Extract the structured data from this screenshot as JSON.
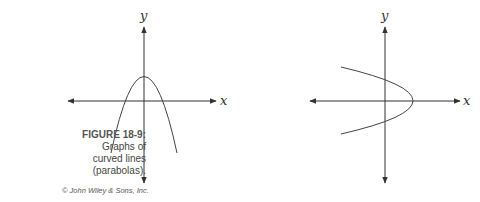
{
  "figure": {
    "label": "FIGURE 18-9:",
    "caption_lines": [
      "Graphs of",
      "curved lines",
      "(parabolas)."
    ],
    "credit": "© John Wiley & Sons, Inc."
  },
  "graphs": [
    {
      "name": "downward-parabola",
      "x_axis_label": "x",
      "y_axis_label": "y",
      "orientation": "opens-down"
    },
    {
      "name": "leftward-parabola",
      "x_axis_label": "x",
      "y_axis_label": "y",
      "orientation": "opens-left"
    }
  ],
  "colors": {
    "axis": "#333333",
    "curve": "#444444"
  }
}
